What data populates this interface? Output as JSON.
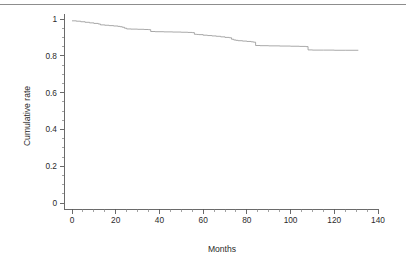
{
  "figure": {
    "background_color": "#ffffff",
    "top_rule_color": "#8d8d8d",
    "axis_color": "#5a5a5a",
    "curve_color": "#9a9a9a"
  },
  "chart_data": {
    "type": "line",
    "subtype": "kaplan-meier-step",
    "title": "",
    "subtitle": "",
    "xlabel": "Months",
    "ylabel": "Cumulative rate",
    "xlim": [
      0,
      140
    ],
    "ylim": [
      0,
      1
    ],
    "grid": false,
    "legend": null,
    "legend_position": "none",
    "x_ticks": [
      0,
      20,
      40,
      60,
      80,
      100,
      120,
      140
    ],
    "x_tick_labels": [
      "0",
      "20",
      "40",
      "60",
      "80",
      "100",
      "120",
      "140"
    ],
    "x_minor_tick_interval": 5,
    "y_ticks": [
      0,
      0.2,
      0.4,
      0.6,
      0.8,
      1
    ],
    "y_tick_labels": [
      "0",
      "0.2",
      "0.4",
      "0.6",
      "0.8",
      "1"
    ],
    "y_minor_tick_interval": 0.05,
    "series": [
      {
        "name": "Cumulative rate",
        "color": "#9a9a9a",
        "x": [
          0,
          2,
          4,
          6,
          8,
          10,
          12,
          13,
          15,
          17,
          19,
          21,
          22,
          23,
          24,
          25,
          27,
          30,
          33,
          35,
          36,
          38,
          42,
          46,
          50,
          53,
          55,
          56,
          57,
          58,
          60,
          62,
          64,
          66,
          68,
          70,
          72,
          73,
          74,
          75,
          76,
          78,
          80,
          82,
          83,
          84,
          86,
          90,
          95,
          100,
          104,
          107,
          108,
          110,
          115,
          120,
          125,
          131
        ],
        "y": [
          0.99,
          0.988,
          0.985,
          0.982,
          0.979,
          0.976,
          0.973,
          0.968,
          0.966,
          0.964,
          0.962,
          0.96,
          0.958,
          0.955,
          0.95,
          0.946,
          0.945,
          0.944,
          0.943,
          0.942,
          0.932,
          0.931,
          0.93,
          0.929,
          0.928,
          0.927,
          0.926,
          0.917,
          0.916,
          0.915,
          0.912,
          0.91,
          0.908,
          0.906,
          0.903,
          0.9,
          0.898,
          0.89,
          0.886,
          0.884,
          0.882,
          0.88,
          0.878,
          0.876,
          0.874,
          0.856,
          0.855,
          0.854,
          0.853,
          0.852,
          0.851,
          0.85,
          0.832,
          0.831,
          0.831,
          0.83,
          0.83,
          0.83
        ]
      }
    ],
    "annotations": [],
    "notes": {
      "start_value": 0.99,
      "end_value": 0.83,
      "x_end": 131
    }
  }
}
